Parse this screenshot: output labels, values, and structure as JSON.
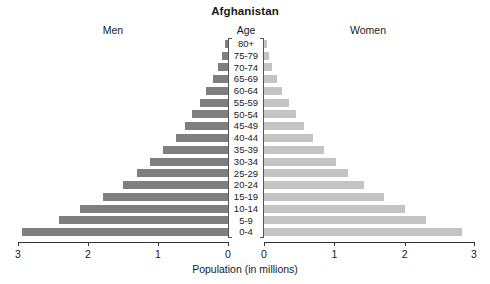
{
  "chart_data": {
    "type": "bar",
    "subtype": "population-pyramid",
    "title": "Afghanistan",
    "xlabel": "Population (in millions)",
    "ylabel": "Age",
    "categories": [
      "80+",
      "75-79",
      "70-74",
      "65-69",
      "60-64",
      "55-59",
      "50-54",
      "45-49",
      "40-44",
      "35-39",
      "30-34",
      "25-29",
      "20-24",
      "15-19",
      "10-14",
      "5-9",
      "0-4"
    ],
    "series": [
      {
        "name": "Men",
        "side": "left",
        "color": "#7f7f7f",
        "values": [
          0.05,
          0.09,
          0.15,
          0.22,
          0.31,
          0.4,
          0.52,
          0.62,
          0.75,
          0.93,
          1.12,
          1.3,
          1.5,
          1.78,
          2.12,
          2.42,
          2.95
        ]
      },
      {
        "name": "Women",
        "side": "right",
        "color": "#c4c4c4",
        "values": [
          0.04,
          0.07,
          0.12,
          0.19,
          0.26,
          0.35,
          0.45,
          0.57,
          0.7,
          0.85,
          1.02,
          1.2,
          1.42,
          1.7,
          2.0,
          2.3,
          2.82
        ]
      }
    ],
    "xlim_left": [
      3,
      0
    ],
    "xlim_right": [
      0,
      3
    ],
    "xticks_left": [
      "3",
      "2",
      "1",
      "0"
    ],
    "xticks_right": [
      "0",
      "1",
      "2",
      "3"
    ],
    "xtick_values_left": [
      3,
      2,
      1,
      0
    ],
    "xtick_values_right": [
      0,
      1,
      2,
      3
    ],
    "grid": false,
    "legend": "none",
    "legend_position": "column-headers"
  },
  "header": {
    "title": "Afghanistan",
    "men_label": "Men",
    "age_label": "Age",
    "women_label": "Women"
  },
  "axis": {
    "x_title": "Population (in millions)"
  }
}
